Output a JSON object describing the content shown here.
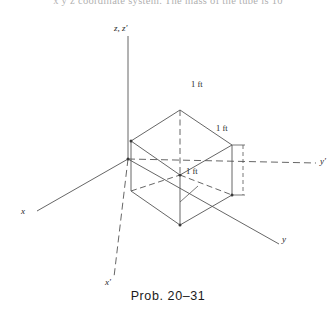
{
  "page": {
    "background_color": "#ffffff",
    "line_color": "#555555",
    "text_color": "#262626"
  },
  "header_text": {
    "clipped_line": "x y z  coordinate system. The mass of the tube is 10"
  },
  "figure": {
    "caption": "Prob. 20–31",
    "axes": [
      {
        "name": "z-axis",
        "label": "z, z′",
        "style": "solid",
        "direction": "up"
      },
      {
        "name": "x-axis",
        "label": "x",
        "style": "solid",
        "direction": "lower-left"
      },
      {
        "name": "y-axis",
        "label": "y",
        "style": "solid",
        "direction": "lower-right"
      },
      {
        "name": "y-prime-axis",
        "label": "y′",
        "style": "dashed",
        "direction": "right"
      },
      {
        "name": "x-prime-axis",
        "label": "x′",
        "style": "dashed",
        "direction": "down"
      }
    ],
    "axis_labels": {
      "z": "z, z′",
      "x": "x",
      "y": "y",
      "y_prime": "y′",
      "x_prime": "x′"
    },
    "dimensions": [
      {
        "id": "top-edge",
        "label": "1 ft"
      },
      {
        "id": "right-edge",
        "label": "1 ft"
      },
      {
        "id": "bottom-edge",
        "label": "1 ft"
      }
    ],
    "dimension_label": "1 ft",
    "shape": {
      "type": "cube",
      "edge_length": "1 ft",
      "projection": "isometric"
    }
  }
}
